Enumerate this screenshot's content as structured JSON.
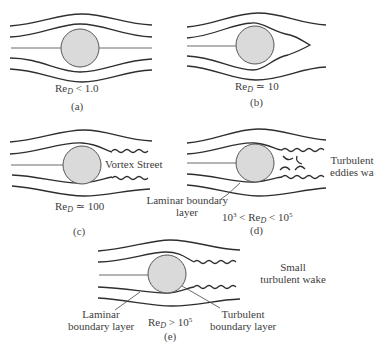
{
  "figure": {
    "colors": {
      "streamline": "#2e2e2e",
      "cylinder_fill": "#d9d9d9",
      "cylinder_stroke": "#555555",
      "text": "#3d3d3d"
    },
    "panels": [
      {
        "id": "a",
        "tag": "(a)",
        "re_label": {
          "prefix": "Re",
          "sub": "D",
          "relation": "< 1.0"
        },
        "description": "Attached creeping flow, symmetric streamlines"
      },
      {
        "id": "b",
        "tag": "(b)",
        "re_label": {
          "prefix": "Re",
          "sub": "D",
          "relation": "≃ 10"
        },
        "description": "Closed recirculation wake behind cylinder"
      },
      {
        "id": "c",
        "tag": "(c)",
        "re_label": {
          "prefix": "Re",
          "sub": "D",
          "relation": "≃ 100"
        },
        "annotations": [
          "Vortex Street"
        ]
      },
      {
        "id": "d",
        "tag": "(d)",
        "re_label": {
          "pre": "10",
          "pre_sup": "3",
          "mid": " < ",
          "prefix": "Re",
          "sub": "D",
          "relation": " < 10",
          "sup": "5"
        },
        "annotations": [
          "Turbulent",
          "eddies wake",
          "Laminar boundary",
          "layer"
        ]
      },
      {
        "id": "e",
        "tag": "(e)",
        "re_label": {
          "prefix": "Re",
          "sub": "D",
          "relation": "> 10",
          "sup": "5"
        },
        "annotations": [
          "Small",
          "turbulent wake",
          "Laminar",
          "boundary layer",
          "Turbulent",
          "boundary layer"
        ]
      }
    ]
  }
}
